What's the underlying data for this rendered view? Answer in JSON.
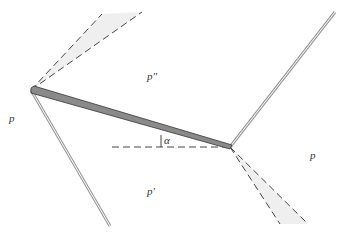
{
  "diagram": {
    "labels": {
      "p_left": "p",
      "p_double_prime": "p″",
      "p_prime": "p′",
      "p_right": "p",
      "alpha": "α"
    },
    "colors": {
      "plate_fill": "#8a8a8a",
      "plate_edge": "#333333",
      "wave_line": "#bbbbbb",
      "fan_fill": "#eeeeee",
      "dash": "#444444",
      "text": "#333333"
    }
  }
}
